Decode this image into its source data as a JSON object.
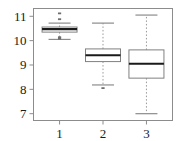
{
  "chart_data": {
    "type": "box",
    "title": "",
    "xlabel": "",
    "ylabel": "",
    "xlim": [
      0.4,
      3.6
    ],
    "ylim": [
      6.72,
      11.32
    ],
    "grid": false,
    "legend": null,
    "x_tick_labels": [
      "1",
      "2",
      "3"
    ],
    "x_tick_values": [
      1,
      2,
      3
    ],
    "y_tick_labels": [
      "7",
      "8",
      "9",
      "10",
      "11"
    ],
    "y_tick_values": [
      7,
      8,
      9,
      10,
      11
    ],
    "categories": [
      "1",
      "2",
      "3"
    ],
    "boxes": [
      {
        "label": "1",
        "x": 1,
        "whisker_low": 10.05,
        "q1": 10.35,
        "median": 10.47,
        "q3": 10.56,
        "whisker_high": 10.72,
        "outliers": [
          11.12,
          10.88,
          10.14,
          10.08
        ]
      },
      {
        "label": "2",
        "x": 2,
        "whisker_low": 8.18,
        "q1": 9.14,
        "median": 9.4,
        "q3": 9.66,
        "whisker_high": 10.72,
        "outliers": [
          8.05
        ]
      },
      {
        "label": "3",
        "x": 3,
        "whisker_low": 7.0,
        "q1": 8.46,
        "median": 9.05,
        "q3": 9.62,
        "whisker_high": 11.05,
        "outliers": []
      }
    ],
    "style": {
      "box_line_color": "#808080",
      "median_line_color": "#1a1a1a",
      "whisker_line_color": "#9a9a9a",
      "whisker_dash": "1.5 2",
      "cap_line_color": "#8c8c8c",
      "outlier_color": "#6e6e6e",
      "frame_color": "#8c8c8c",
      "tick_color": "#8c8c8c",
      "background": "#ffffff",
      "box_fill": "#ffffff"
    }
  }
}
